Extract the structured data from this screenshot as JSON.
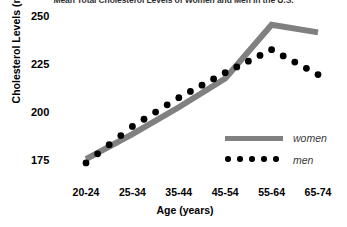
{
  "chart_data": {
    "type": "line",
    "title": "Mean Total Cholesterol Levels of Women and Men in the U.S.",
    "xlabel": "Age (years)",
    "ylabel": "Cholesterol Levels (mg/dL)",
    "categories": [
      "20-24",
      "25-34",
      "35-44",
      "45-54",
      "55-64",
      "65-74"
    ],
    "yticks": [
      250,
      225,
      200,
      175
    ],
    "ylim": [
      170,
      252
    ],
    "grid": false,
    "legend_position": "bottom-right",
    "series": [
      {
        "name": "women",
        "style": "solid-thick-line",
        "color": "#808080",
        "values": [
          176,
          189,
          203,
          218,
          246,
          242
        ]
      },
      {
        "name": "men",
        "style": "dotted-markers",
        "color": "#000000",
        "values": [
          174,
          193,
          208,
          221,
          233,
          220
        ]
      }
    ]
  },
  "legend": {
    "women_label": "women",
    "men_label": "men"
  }
}
